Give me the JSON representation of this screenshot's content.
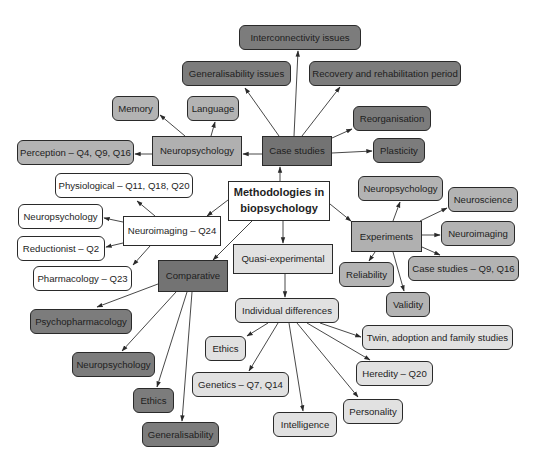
{
  "diagram": {
    "type": "mind-map",
    "center": {
      "id": "center",
      "label": "Methodologies in biopsychology"
    },
    "colors": {
      "white": "#ffffff",
      "light_grey": "#e1e1e1",
      "mid_grey": "#b3b3b3",
      "dark_grey": "#7c7c7c",
      "line": "#333333"
    },
    "nodes": [
      {
        "id": "center",
        "label": "Methodologies in biopsychology",
        "x": 228,
        "y": 181,
        "w": 102,
        "h": 40,
        "shape": "square",
        "color": "white"
      },
      {
        "id": "case_studies",
        "label": "Case studies",
        "x": 262,
        "y": 136,
        "w": 70,
        "h": 30,
        "shape": "square",
        "color": "darksq"
      },
      {
        "id": "cs_interconnectivity",
        "label": "Interconnectivity issues",
        "x": 239,
        "y": 25,
        "w": 122,
        "h": 25,
        "shape": "rounded",
        "color": "dark"
      },
      {
        "id": "cs_generalisability",
        "label": "Generalisability issues",
        "x": 182,
        "y": 61,
        "w": 109,
        "h": 25,
        "shape": "rounded",
        "color": "dark"
      },
      {
        "id": "cs_recovery",
        "label": "Recovery and rehabilitation period",
        "x": 309,
        "y": 61,
        "w": 152,
        "h": 25,
        "shape": "rounded",
        "color": "dark"
      },
      {
        "id": "cs_reorganisation",
        "label": "Reorganisation",
        "x": 353,
        "y": 106,
        "w": 78,
        "h": 25,
        "shape": "rounded",
        "color": "dark"
      },
      {
        "id": "cs_plasticity",
        "label": "Plasticity",
        "x": 373,
        "y": 138,
        "w": 52,
        "h": 25,
        "shape": "rounded",
        "color": "dark"
      },
      {
        "id": "neuropsychology",
        "label": "Neuropsychology",
        "x": 152,
        "y": 136,
        "w": 90,
        "h": 30,
        "shape": "square",
        "color": "midsq"
      },
      {
        "id": "np_memory",
        "label": "Memory",
        "x": 112,
        "y": 96,
        "w": 47,
        "h": 25,
        "shape": "rounded",
        "color": "mid"
      },
      {
        "id": "np_language",
        "label": "Language",
        "x": 187,
        "y": 96,
        "w": 52,
        "h": 25,
        "shape": "rounded",
        "color": "mid"
      },
      {
        "id": "np_perception",
        "label": "Perception – Q4, Q9, Q16",
        "x": 17,
        "y": 140,
        "w": 117,
        "h": 25,
        "shape": "rounded",
        "color": "mid"
      },
      {
        "id": "neuroimaging",
        "label": "Neuroimaging – Q24",
        "x": 123,
        "y": 216,
        "w": 98,
        "h": 30,
        "shape": "square",
        "color": "white"
      },
      {
        "id": "ni_physiological",
        "label": "Physiological – Q11, Q18, Q20",
        "x": 55,
        "y": 173,
        "w": 138,
        "h": 25,
        "shape": "rounded",
        "color": "white"
      },
      {
        "id": "ni_neuropsychology",
        "label": "Neuropsychology",
        "x": 18,
        "y": 204,
        "w": 85,
        "h": 25,
        "shape": "rounded",
        "color": "white"
      },
      {
        "id": "ni_reductionist",
        "label": "Reductionist – Q2",
        "x": 17,
        "y": 236,
        "w": 88,
        "h": 25,
        "shape": "rounded",
        "color": "white"
      },
      {
        "id": "ni_pharmacology",
        "label": "Pharmacology – Q23",
        "x": 33,
        "y": 266,
        "w": 99,
        "h": 25,
        "shape": "rounded",
        "color": "white"
      },
      {
        "id": "comparative",
        "label": "Comparative",
        "x": 158,
        "y": 260,
        "w": 70,
        "h": 32,
        "shape": "square",
        "color": "darksq"
      },
      {
        "id": "cmp_psychopharmacology",
        "label": "Psychopharmacology",
        "x": 30,
        "y": 309,
        "w": 102,
        "h": 25,
        "shape": "rounded",
        "color": "dark"
      },
      {
        "id": "cmp_neuropsychology",
        "label": "Neuropsychology",
        "x": 72,
        "y": 352,
        "w": 83,
        "h": 25,
        "shape": "rounded",
        "color": "dark"
      },
      {
        "id": "cmp_ethics",
        "label": "Ethics",
        "x": 133,
        "y": 388,
        "w": 41,
        "h": 25,
        "shape": "rounded",
        "color": "dark"
      },
      {
        "id": "cmp_generalisability",
        "label": "Generalisability",
        "x": 142,
        "y": 422,
        "w": 77,
        "h": 25,
        "shape": "rounded",
        "color": "dark"
      },
      {
        "id": "quasi",
        "label": "Quasi-experimental",
        "x": 233,
        "y": 244,
        "w": 100,
        "h": 30,
        "shape": "square",
        "color": "light"
      },
      {
        "id": "individual_differences",
        "label": "Individual differences",
        "x": 235,
        "y": 298,
        "w": 104,
        "h": 25,
        "shape": "rounded",
        "color": "light"
      },
      {
        "id": "id_ethics",
        "label": "Ethics",
        "x": 205,
        "y": 336,
        "w": 41,
        "h": 25,
        "shape": "rounded",
        "color": "light"
      },
      {
        "id": "id_genetics",
        "label": "Genetics – Q7, Q14",
        "x": 192,
        "y": 372,
        "w": 97,
        "h": 25,
        "shape": "rounded",
        "color": "light"
      },
      {
        "id": "id_intelligence",
        "label": "Intelligence",
        "x": 273,
        "y": 412,
        "w": 64,
        "h": 25,
        "shape": "rounded",
        "color": "light"
      },
      {
        "id": "id_personality",
        "label": "Personality",
        "x": 343,
        "y": 399,
        "w": 60,
        "h": 25,
        "shape": "rounded",
        "color": "light"
      },
      {
        "id": "id_heredity",
        "label": "Heredity – Q20",
        "x": 356,
        "y": 361,
        "w": 77,
        "h": 25,
        "shape": "rounded",
        "color": "light"
      },
      {
        "id": "id_twin",
        "label": "Twin, adoption and family studies",
        "x": 362,
        "y": 325,
        "w": 151,
        "h": 25,
        "shape": "rounded",
        "color": "light"
      },
      {
        "id": "experiments",
        "label": "Experiments",
        "x": 351,
        "y": 221,
        "w": 71,
        "h": 31,
        "shape": "square",
        "color": "midsq"
      },
      {
        "id": "ex_neuropsychology",
        "label": "Neuropsychology",
        "x": 358,
        "y": 176,
        "w": 85,
        "h": 25,
        "shape": "rounded",
        "color": "mid"
      },
      {
        "id": "ex_neuroscience",
        "label": "Neuroscience",
        "x": 448,
        "y": 187,
        "w": 70,
        "h": 25,
        "shape": "rounded",
        "color": "mid"
      },
      {
        "id": "ex_neuroimaging",
        "label": "Neuroimaging",
        "x": 441,
        "y": 221,
        "w": 74,
        "h": 25,
        "shape": "rounded",
        "color": "mid"
      },
      {
        "id": "ex_case_studies",
        "label": "Case studies – Q9, Q16",
        "x": 408,
        "y": 256,
        "w": 111,
        "h": 25,
        "shape": "rounded",
        "color": "mid"
      },
      {
        "id": "ex_reliability",
        "label": "Reliability",
        "x": 339,
        "y": 262,
        "w": 55,
        "h": 25,
        "shape": "rounded",
        "color": "mid"
      },
      {
        "id": "ex_validity",
        "label": "Validity",
        "x": 386,
        "y": 292,
        "w": 44,
        "h": 25,
        "shape": "rounded",
        "color": "mid"
      }
    ],
    "edges": [
      {
        "from": "center",
        "to": "case_studies",
        "x1": 280,
        "y1": 181,
        "x2": 280,
        "y2": 167
      },
      {
        "from": "center",
        "to": "neuroimaging",
        "x1": 228,
        "y1": 200,
        "x2": 207,
        "y2": 216
      },
      {
        "from": "center",
        "to": "comparative",
        "x1": 252,
        "y1": 221,
        "x2": 213,
        "y2": 260
      },
      {
        "from": "center",
        "to": "quasi",
        "x1": 283,
        "y1": 221,
        "x2": 283,
        "y2": 243
      },
      {
        "from": "center",
        "to": "experiments",
        "x1": 330,
        "y1": 204,
        "x2": 351,
        "y2": 221
      },
      {
        "from": "case_studies",
        "to": "neuropsychology",
        "x1": 262,
        "y1": 154,
        "x2": 243,
        "y2": 154
      },
      {
        "from": "case_studies",
        "to": "cs_generalisability",
        "x1": 279,
        "y1": 136,
        "x2": 245,
        "y2": 88
      },
      {
        "from": "case_studies",
        "to": "cs_interconnectivity",
        "x1": 294,
        "y1": 136,
        "x2": 298,
        "y2": 51
      },
      {
        "from": "case_studies",
        "to": "cs_recovery",
        "x1": 302,
        "y1": 136,
        "x2": 340,
        "y2": 87
      },
      {
        "from": "case_studies",
        "to": "cs_reorganisation",
        "x1": 332,
        "y1": 138,
        "x2": 352,
        "y2": 129
      },
      {
        "from": "case_studies",
        "to": "cs_plasticity",
        "x1": 332,
        "y1": 153,
        "x2": 372,
        "y2": 151
      },
      {
        "from": "neuropsychology",
        "to": "np_memory",
        "x1": 185,
        "y1": 136,
        "x2": 160,
        "y2": 115
      },
      {
        "from": "neuropsychology",
        "to": "np_language",
        "x1": 211,
        "y1": 136,
        "x2": 215,
        "y2": 122
      },
      {
        "from": "neuropsychology",
        "to": "np_perception",
        "x1": 152,
        "y1": 154,
        "x2": 135,
        "y2": 154
      },
      {
        "from": "neuroimaging",
        "to": "ni_physiological",
        "x1": 155,
        "y1": 216,
        "x2": 137,
        "y2": 201
      },
      {
        "from": "neuroimaging",
        "to": "ni_neuropsychology",
        "x1": 123,
        "y1": 222,
        "x2": 104,
        "y2": 218
      },
      {
        "from": "neuroimaging",
        "to": "ni_reductionist",
        "x1": 123,
        "y1": 243,
        "x2": 106,
        "y2": 247
      },
      {
        "from": "neuroimaging",
        "to": "ni_pharmacology",
        "x1": 150,
        "y1": 246,
        "x2": 133,
        "y2": 265
      },
      {
        "from": "comparative",
        "to": "cmp_psychopharmacology",
        "x1": 158,
        "y1": 284,
        "x2": 97,
        "y2": 307
      },
      {
        "from": "comparative",
        "to": "cmp_neuropsychology",
        "x1": 176,
        "y1": 292,
        "x2": 122,
        "y2": 351
      },
      {
        "from": "comparative",
        "to": "cmp_ethics",
        "x1": 187,
        "y1": 292,
        "x2": 157,
        "y2": 387
      },
      {
        "from": "comparative",
        "to": "cmp_generalisability",
        "x1": 192,
        "y1": 292,
        "x2": 182,
        "y2": 421
      },
      {
        "from": "quasi",
        "to": "individual_differences",
        "x1": 285,
        "y1": 274,
        "x2": 285,
        "y2": 297
      },
      {
        "from": "individual_differences",
        "to": "id_ethics",
        "x1": 268,
        "y1": 323,
        "x2": 247,
        "y2": 336
      },
      {
        "from": "individual_differences",
        "to": "id_genetics",
        "x1": 278,
        "y1": 323,
        "x2": 249,
        "y2": 371
      },
      {
        "from": "individual_differences",
        "to": "id_intelligence",
        "x1": 289,
        "y1": 323,
        "x2": 303,
        "y2": 411
      },
      {
        "from": "individual_differences",
        "to": "id_personality",
        "x1": 297,
        "y1": 323,
        "x2": 358,
        "y2": 397
      },
      {
        "from": "individual_differences",
        "to": "id_heredity",
        "x1": 307,
        "y1": 323,
        "x2": 370,
        "y2": 360
      },
      {
        "from": "individual_differences",
        "to": "id_twin",
        "x1": 320,
        "y1": 323,
        "x2": 361,
        "y2": 337
      },
      {
        "from": "experiments",
        "to": "ex_neuropsychology",
        "x1": 393,
        "y1": 221,
        "x2": 400,
        "y2": 202
      },
      {
        "from": "experiments",
        "to": "ex_neuroscience",
        "x1": 420,
        "y1": 221,
        "x2": 447,
        "y2": 208
      },
      {
        "from": "experiments",
        "to": "ex_neuroimaging",
        "x1": 422,
        "y1": 235,
        "x2": 440,
        "y2": 235
      },
      {
        "from": "experiments",
        "to": "ex_case_studies",
        "x1": 422,
        "y1": 247,
        "x2": 440,
        "y2": 255
      },
      {
        "from": "experiments",
        "to": "ex_reliability",
        "x1": 375,
        "y1": 252,
        "x2": 369,
        "y2": 261
      },
      {
        "from": "experiments",
        "to": "ex_validity",
        "x1": 393,
        "y1": 252,
        "x2": 404,
        "y2": 291
      }
    ]
  }
}
